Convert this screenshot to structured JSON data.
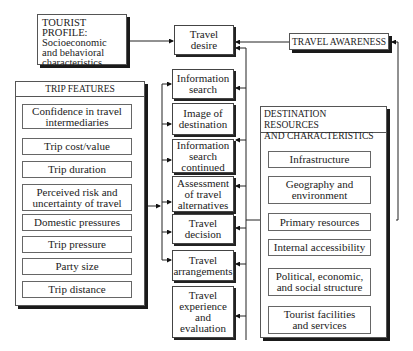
{
  "tourist_profile": {
    "title": "TOURIST PROFILE:",
    "body": "Socioeconomic\nand behavioral\ncharacteristics"
  },
  "travel_awareness": "TRAVEL AWARENESS",
  "trip_features": {
    "title": "TRIP FEATURES",
    "items": [
      "Confidence in travel\nintermediaries",
      "Trip cost/value",
      "Trip duration",
      "Perceived risk and\nuncertainty of travel",
      "Domestic pressures",
      "Trip pressure",
      "Party size",
      "Trip distance"
    ]
  },
  "process": [
    "Travel\ndesire",
    "Information\nsearch",
    "Image of\ndestination",
    "Information\nsearch\ncontinued",
    "Assessment\nof travel\nalternatives",
    "Travel\ndecision",
    "Travel\narrangements",
    "Travel\nexperience\nand\nevaluation"
  ],
  "destination": {
    "title": "DESTINATION RESOURCES\nAND  CHARACTERISTICS",
    "items": [
      "Infrastructure",
      "Geography and\nenvironment",
      "Primary resources",
      "Internal accessibility",
      "Political, economic,\nand social structure",
      "Tourist facilities\nand services"
    ]
  }
}
